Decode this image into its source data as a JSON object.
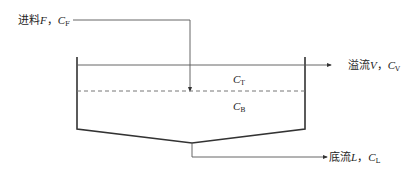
{
  "diagram": {
    "type": "settling tank / thickener flow diagram",
    "feed": {
      "prefix": "进料",
      "var": "F",
      "sep": "，",
      "conc": "C",
      "conc_sub": "F"
    },
    "overflow": {
      "prefix": "溢流",
      "var": "V",
      "sep": "，",
      "conc": "C",
      "conc_sub": "V"
    },
    "underflow": {
      "prefix": "底流",
      "var": "L",
      "sep": "，",
      "conc": "C",
      "conc_sub": "L"
    },
    "top_zone": {
      "conc": "C",
      "conc_sub": "T"
    },
    "bottom_zone": {
      "conc": "C",
      "conc_sub": "B"
    },
    "colors": {
      "line": "#333333",
      "thin_line": "#555555",
      "dashed": "#777777"
    }
  }
}
